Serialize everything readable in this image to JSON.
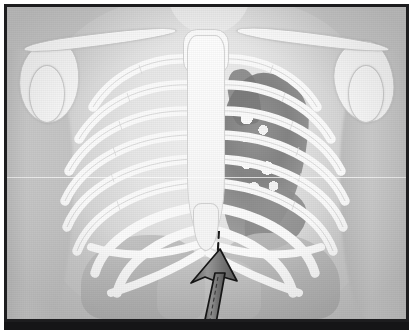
{
  "figure": {
    "title": "Subxiphoid pericardiocentesis needle insertion",
    "modality": "grayscale anatomical illustration",
    "view": "anterior thoracic view",
    "frame_color": "#1d1d1f",
    "background_color": "#d8d8d8"
  },
  "anatomy": {
    "skeleton": {
      "clavicle_left": "left clavicle",
      "clavicle_right": "right clavicle",
      "scapula_left": "left scapula",
      "scapula_right": "right scapula",
      "humerus_left": "left humeral head",
      "humerus_right": "right humeral head",
      "manubrium": "manubrium",
      "sternum": "sternum body",
      "xiphoid": "xiphoid process",
      "rib_count_per_side": 8,
      "costal_margin": "costal margin"
    },
    "organs": {
      "heart": "heart",
      "heart_apex": "cardiac apex",
      "great_vessel": "great vessel",
      "valves_upper": "upper valve structures",
      "valves_lower": "lower valve structures",
      "viscera_left": "left upper abdominal viscera",
      "viscera_right": "right upper abdominal viscera",
      "viscera_mid": "epigastric region"
    },
    "soft_tissue": {
      "torso": "thoracic wall",
      "neck": "suprasternal notch",
      "arm_left": "left arm",
      "arm_right": "right arm"
    }
  },
  "annotation": {
    "instrument": "pericardiocentesis needle with syringe",
    "needle_shaft": "needle shaft",
    "needle_head": "needle arrowhead / direction indicator",
    "needle_hub": "syringe hub",
    "wing_left": "left finger wing",
    "wing_right": "right finger wing",
    "trajectory": "dashed insertion trajectory toward the heart",
    "trajectory_style": "dashed",
    "trajectory_color": "#1b1b1b",
    "entry_point": "subxiphoid entry point",
    "direction": "upward and slightly leftward toward the cardiac apex"
  },
  "colors": {
    "bone": "#fbfbfb",
    "bone_outline": "#cdcdcd",
    "heart": "#8a8a8a",
    "viscera": "#bdbdbd",
    "instrument_fill": "#8b8b8b",
    "instrument_outline": "#1b1b1b",
    "skin": "#dcdcdc"
  }
}
